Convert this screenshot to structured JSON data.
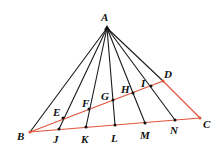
{
  "diagram": {
    "colors": {
      "black_lines": "#1a1a1a",
      "red_lines": "#e0553a",
      "points": "#111111"
    },
    "points": {
      "A": {
        "x": 107,
        "y": 28,
        "label": "A",
        "lx": 101,
        "ly": 21
      },
      "B": {
        "x": 30,
        "y": 132,
        "label": "B",
        "lx": 17,
        "ly": 140
      },
      "C": {
        "x": 200,
        "y": 118,
        "label": "C",
        "lx": 203,
        "ly": 128
      },
      "D": {
        "x": 163,
        "y": 81,
        "label": "D",
        "lx": 164,
        "ly": 78
      },
      "E": {
        "x": 63,
        "y": 118,
        "label": "E",
        "lx": 53,
        "ly": 116
      },
      "F": {
        "x": 89,
        "y": 109,
        "label": "F",
        "lx": 82,
        "ly": 107
      },
      "G": {
        "x": 113,
        "y": 100,
        "label": "G",
        "lx": 101,
        "ly": 100
      },
      "H": {
        "x": 133,
        "y": 93,
        "label": "H",
        "lx": 121,
        "ly": 93
      },
      "I": {
        "x": 151,
        "y": 86,
        "label": "I",
        "lx": 141,
        "ly": 87
      },
      "J": {
        "x": 59,
        "y": 129,
        "label": "J",
        "lx": 53,
        "ly": 143
      },
      "K": {
        "x": 86,
        "y": 127,
        "label": "K",
        "lx": 81,
        "ly": 143
      },
      "L": {
        "x": 115,
        "y": 125,
        "label": "L",
        "lx": 111,
        "ly": 142
      },
      "M": {
        "x": 145,
        "y": 123,
        "label": "M",
        "lx": 140,
        "ly": 139
      },
      "N": {
        "x": 175,
        "y": 120,
        "label": "N",
        "lx": 170,
        "ly": 134
      }
    },
    "black_segments": [
      [
        "A",
        "B"
      ],
      [
        "A",
        "J"
      ],
      [
        "A",
        "K"
      ],
      [
        "A",
        "L"
      ],
      [
        "A",
        "M"
      ],
      [
        "A",
        "N"
      ],
      [
        "A",
        "D"
      ]
    ],
    "red_segments": [
      [
        "B",
        "C"
      ],
      [
        "B",
        "D"
      ],
      [
        "D",
        "C"
      ]
    ]
  }
}
